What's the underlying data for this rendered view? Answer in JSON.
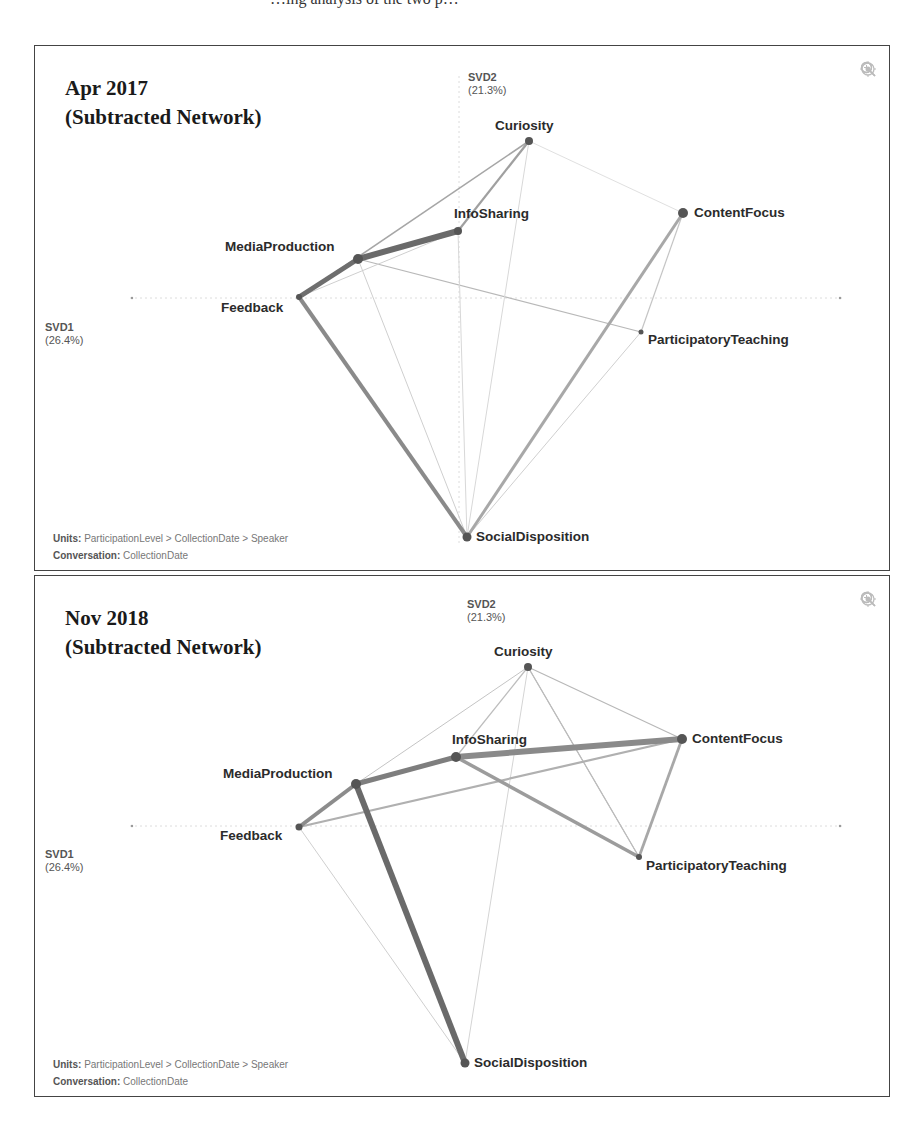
{
  "caption_fragment": "…ing analysis of the two p…",
  "panels": [
    {
      "title_line1": "Apr 2017",
      "title_line2": "(Subtracted Network)",
      "axis_x": {
        "name": "SVD1",
        "pct": "(26.4%)"
      },
      "axis_y": {
        "name": "SVD2",
        "pct": "(21.3%)"
      },
      "footer_units_label": "Units:",
      "footer_units_value": "ParticipationLevel > CollectionDate > Speaker",
      "footer_conv_label": "Conversation:",
      "footer_conv_value": "CollectionDate",
      "tools": [
        "zoom-in-icon",
        "zoom-out-icon",
        "recenter-icon"
      ],
      "nodes": [
        {
          "id": "Curiosity",
          "label": "Curiosity"
        },
        {
          "id": "InfoSharing",
          "label": "InfoSharing"
        },
        {
          "id": "ContentFocus",
          "label": "ContentFocus"
        },
        {
          "id": "MediaProduction",
          "label": "MediaProduction"
        },
        {
          "id": "Feedback",
          "label": "Feedback"
        },
        {
          "id": "ParticipatoryTeaching",
          "label": "ParticipatoryTeaching"
        },
        {
          "id": "SocialDisposition",
          "label": "SocialDisposition"
        }
      ]
    },
    {
      "title_line1": "Nov 2018",
      "title_line2": "(Subtracted Network)",
      "axis_x": {
        "name": "SVD1",
        "pct": "(26.4%)"
      },
      "axis_y": {
        "name": "SVD2",
        "pct": "(21.3%)"
      },
      "footer_units_label": "Units:",
      "footer_units_value": "ParticipationLevel > CollectionDate > Speaker",
      "footer_conv_label": "Conversation:",
      "footer_conv_value": "CollectionDate",
      "tools": [
        "zoom-in-icon",
        "zoom-out-icon",
        "recenter-icon"
      ],
      "nodes": [
        {
          "id": "Curiosity",
          "label": "Curiosity"
        },
        {
          "id": "InfoSharing",
          "label": "InfoSharing"
        },
        {
          "id": "ContentFocus",
          "label": "ContentFocus"
        },
        {
          "id": "MediaProduction",
          "label": "MediaProduction"
        },
        {
          "id": "Feedback",
          "label": "Feedback"
        },
        {
          "id": "ParticipatoryTeaching",
          "label": "ParticipatoryTeaching"
        },
        {
          "id": "SocialDisposition",
          "label": "SocialDisposition"
        }
      ]
    }
  ],
  "colors": {
    "edge_dark": "#6e6e6e",
    "edge_mid": "#9a9a9a",
    "edge_light": "#c8c8c8",
    "node": "#555555",
    "frame": "#444444"
  }
}
